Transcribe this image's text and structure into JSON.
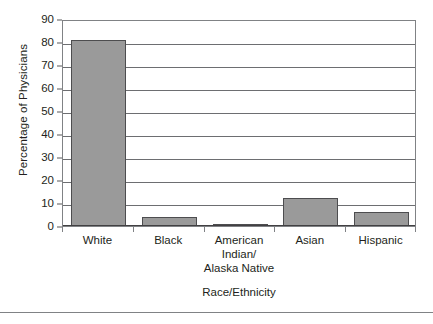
{
  "chart_data": {
    "type": "bar",
    "title": "",
    "xlabel": "Race/Ethnicity",
    "ylabel": "Percentage of Physicians",
    "categories": [
      "White",
      "Black",
      "American Indian/ Alaska Native",
      "Asian",
      "Hispanic"
    ],
    "category_lines": [
      [
        "White"
      ],
      [
        "Black"
      ],
      [
        "American",
        "Indian/",
        "Alaska Native"
      ],
      [
        "Asian"
      ],
      [
        "Hispanic"
      ]
    ],
    "values": [
      81,
      4,
      0.5,
      12,
      6
    ],
    "ylim": [
      0,
      90
    ],
    "yticks": [
      0,
      10,
      20,
      30,
      40,
      50,
      60,
      70,
      80,
      90
    ],
    "ytick_labels": [
      "0",
      "10",
      "20",
      "30",
      "40",
      "50",
      "60",
      "70",
      "80",
      "90"
    ],
    "grid": "horizontal",
    "legend": "none",
    "bar_color": "#9a9a9a",
    "bar_edge_color": "#4d4d4f",
    "axis_color": "#808285",
    "text_color": "#231f20"
  }
}
